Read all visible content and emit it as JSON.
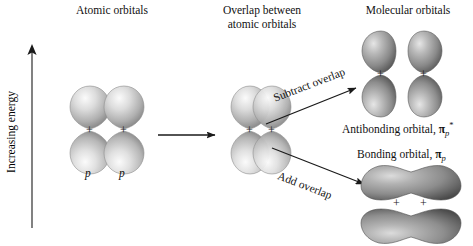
{
  "figure": {
    "axis_label": "Increasing energy",
    "headers": {
      "atomic": "Atomic orbitals",
      "overlap_line1": "Overlap between",
      "overlap_line2": "atomic orbitals",
      "molecular": "Molecular orbitals"
    },
    "orbital_labels": {
      "p_left": "p",
      "p_right": "p",
      "antibonding": "Antibonding orbital, ",
      "antibonding_symbol": "π",
      "antibonding_sub": "p",
      "antibonding_star": "*",
      "bonding": "Bonding orbital, ",
      "bonding_symbol": "π",
      "bonding_sub": "p"
    },
    "arrows": {
      "main": "",
      "subtract": "Subtract overlap",
      "add": "Add overlap"
    },
    "node_marks": {
      "mark": "+",
      "count_atomic": 2,
      "count_overlap": 2,
      "count_antibonding": 2,
      "count_bonding": 2
    },
    "colors": {
      "lobe_light": "#f2f2f2",
      "lobe_mid": "#b4b4b4",
      "lobe_dark": "#5f5f5f",
      "lobe_darkest": "#3c3c3c",
      "stroke": "#6b6b6b",
      "text": "#111111",
      "arrow": "#1a1a1a"
    }
  }
}
